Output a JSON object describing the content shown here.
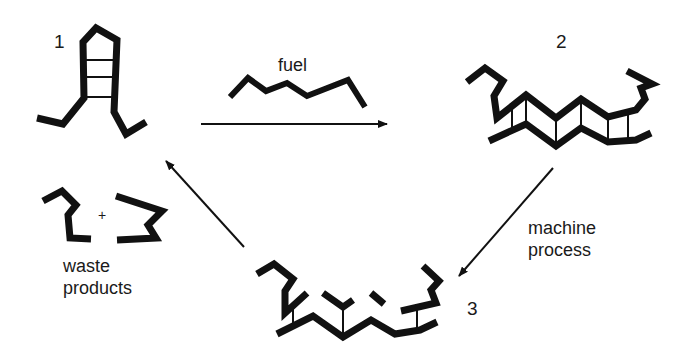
{
  "diagram": {
    "colors": {
      "ink": "#111111",
      "background": "#ffffff"
    },
    "states": [
      {
        "id": "1",
        "label": "1",
        "description": "hairpin"
      },
      {
        "id": "2",
        "label": "2",
        "description": "hybridized duplex with fuel"
      },
      {
        "id": "3",
        "label": "3",
        "description": "duplex after machine process"
      }
    ],
    "labels": {
      "fuel": "fuel",
      "machine_process_line1": "machine",
      "machine_process_line2": "process",
      "waste_line1": "waste",
      "waste_line2": "products",
      "plus": "+"
    },
    "arrows": [
      {
        "from": "1",
        "to": "2",
        "label": "fuel"
      },
      {
        "from": "2",
        "to": "3",
        "label": "machine process"
      },
      {
        "from": "3",
        "to": "1",
        "label": ""
      }
    ]
  }
}
